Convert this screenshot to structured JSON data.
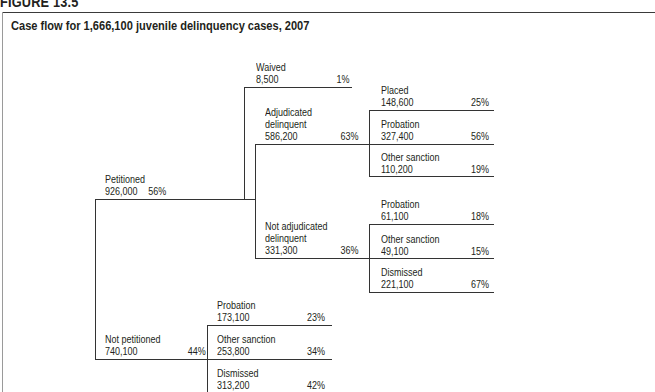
{
  "figure": {
    "label": "FIGURE 13.5",
    "title": "Case flow for 1,666,100 juvenile delinquency cases, 2007"
  },
  "nodes": {
    "petitioned": {
      "label": "Petitioned",
      "count": "926,000",
      "pct": "56%"
    },
    "not_petitioned": {
      "label": "Not petitioned",
      "count": "740,100",
      "pct": "44%"
    },
    "waived": {
      "label": "Waived",
      "count": "8,500",
      "pct": "1%"
    },
    "adjudicated": {
      "label1": "Adjudicated",
      "label2": "delinquent",
      "count": "586,200",
      "pct": "63%"
    },
    "not_adjudicated": {
      "label1": "Not adjudicated",
      "label2": "delinquent",
      "count": "331,300",
      "pct": "36%"
    },
    "adj_placed": {
      "label": "Placed",
      "count": "148,600",
      "pct": "25%"
    },
    "adj_probation": {
      "label": "Probation",
      "count": "327,400",
      "pct": "56%"
    },
    "adj_other": {
      "label": "Other sanction",
      "count": "110,200",
      "pct": "19%"
    },
    "nadj_probation": {
      "label": "Probation",
      "count": "61,100",
      "pct": "18%"
    },
    "nadj_other": {
      "label": "Other sanction",
      "count": "49,100",
      "pct": "15%"
    },
    "nadj_dismissed": {
      "label": "Dismissed",
      "count": "221,100",
      "pct": "67%"
    },
    "np_probation": {
      "label": "Probation",
      "count": "173,100",
      "pct": "23%"
    },
    "np_other": {
      "label": "Other sanction",
      "count": "253,800",
      "pct": "34%"
    },
    "np_dismissed": {
      "label": "Dismissed",
      "count": "313,200",
      "pct": "42%"
    }
  }
}
